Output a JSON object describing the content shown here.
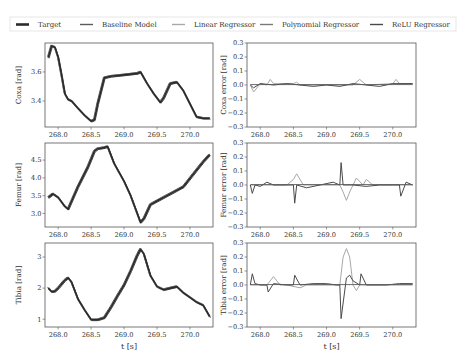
{
  "legend": {
    "items": [
      {
        "label": "Target",
        "color": "#2b2b2b",
        "width": 2.2
      },
      {
        "label": "Baseline Model",
        "color": "#5a5a5a",
        "width": 1.0
      },
      {
        "label": "Linear Regressor",
        "color": "#a8a8a8",
        "width": 1.0
      },
      {
        "label": "Polynomial Regressor",
        "color": "#7a7a7a",
        "width": 1.0
      },
      {
        "label": "ReLU Regressor",
        "color": "#4a4a4a",
        "width": 1.0
      }
    ]
  },
  "chart_data": [
    {
      "type": "line",
      "panel": "coxa",
      "ylabel": "Coxa [rad]",
      "xlabel": "",
      "xlim": [
        267.8,
        270.35
      ],
      "ylim": [
        3.22,
        3.8
      ],
      "xticks": [
        "268.0",
        "268.5",
        "269.0",
        "269.5",
        "270.0"
      ],
      "xtick_values": [
        268.0,
        268.5,
        269.0,
        269.5,
        270.0
      ],
      "yticks": [
        "3.4",
        "3.6"
      ],
      "ytick_values": [
        3.4,
        3.6
      ],
      "series": [
        {
          "name": "Target",
          "x": [
            267.85,
            267.9,
            267.95,
            268.0,
            268.05,
            268.1,
            268.15,
            268.2,
            268.3,
            268.4,
            268.5,
            268.55,
            268.6,
            268.7,
            268.8,
            269.0,
            269.2,
            269.25,
            269.35,
            269.45,
            269.55,
            269.6,
            269.7,
            269.8,
            269.9,
            270.0,
            270.1,
            270.2,
            270.3
          ],
          "y": [
            3.7,
            3.78,
            3.77,
            3.7,
            3.58,
            3.45,
            3.41,
            3.4,
            3.35,
            3.3,
            3.26,
            3.27,
            3.38,
            3.56,
            3.57,
            3.58,
            3.59,
            3.6,
            3.52,
            3.45,
            3.39,
            3.42,
            3.52,
            3.53,
            3.47,
            3.38,
            3.29,
            3.28,
            3.28
          ]
        }
      ]
    },
    {
      "type": "line",
      "panel": "coxa-error",
      "ylabel": "Coxa error [rad]",
      "xlabel": "",
      "xlim": [
        267.8,
        270.35
      ],
      "ylim": [
        -0.3,
        0.3
      ],
      "xticks": [
        "268.0",
        "268.5",
        "269.0",
        "269.5",
        "270.0"
      ],
      "xtick_values": [
        268.0,
        268.5,
        269.0,
        269.5,
        270.0
      ],
      "yticks": [
        "0.3",
        "0.2",
        "0.1",
        "0.0",
        "−0.1",
        "−0.2",
        "−0.3"
      ],
      "ytick_values": [
        0.3,
        0.2,
        0.1,
        0.0,
        -0.1,
        -0.2,
        -0.3
      ],
      "series": [
        {
          "name": "Linear Regressor",
          "x": [
            267.85,
            267.9,
            268.0,
            268.1,
            268.15,
            268.2,
            268.5,
            268.55,
            268.6,
            269.0,
            269.4,
            269.5,
            269.55,
            269.6,
            270.0,
            270.05,
            270.1,
            270.3
          ],
          "y": [
            0.0,
            -0.05,
            0.01,
            0.0,
            0.04,
            0.01,
            0.01,
            0.02,
            0.0,
            0.0,
            0.0,
            0.04,
            0.02,
            0.0,
            0.01,
            0.04,
            0.01,
            0.01
          ]
        },
        {
          "name": "ReLU Regressor",
          "x": [
            267.85,
            267.9,
            268.0,
            268.2,
            268.4,
            268.6,
            268.8,
            269.0,
            269.2,
            269.4,
            269.6,
            269.8,
            270.0,
            270.2,
            270.3
          ],
          "y": [
            0.0,
            -0.02,
            0.01,
            0.0,
            0.01,
            0.0,
            -0.01,
            0.0,
            -0.01,
            0.01,
            0.0,
            -0.01,
            0.01,
            0.01,
            0.01
          ]
        }
      ]
    },
    {
      "type": "line",
      "panel": "femur",
      "ylabel": "Femur [rad]",
      "xlabel": "",
      "xlim": [
        267.8,
        270.35
      ],
      "ylim": [
        2.62,
        4.98
      ],
      "xticks": [
        "268.0",
        "268.5",
        "269.0",
        "269.5",
        "270.0"
      ],
      "xtick_values": [
        268.0,
        268.5,
        269.0,
        269.5,
        270.0
      ],
      "yticks": [
        "3.0",
        "3.5",
        "4.0",
        "4.5"
      ],
      "ytick_values": [
        3.0,
        3.5,
        4.0,
        4.5
      ],
      "series": [
        {
          "name": "Target",
          "x": [
            267.85,
            267.92,
            268.0,
            268.1,
            268.15,
            268.3,
            268.45,
            268.55,
            268.6,
            268.7,
            268.75,
            268.85,
            269.0,
            269.1,
            269.2,
            269.25,
            269.3,
            269.4,
            269.5,
            269.7,
            269.9,
            270.05,
            270.2,
            270.3
          ],
          "y": [
            3.45,
            3.55,
            3.45,
            3.2,
            3.12,
            3.75,
            4.3,
            4.75,
            4.82,
            4.85,
            4.88,
            4.4,
            3.9,
            3.5,
            3.0,
            2.75,
            2.85,
            3.25,
            3.35,
            3.55,
            3.75,
            4.1,
            4.45,
            4.65
          ]
        }
      ]
    },
    {
      "type": "line",
      "panel": "femur-error",
      "ylabel": "Femur error [rad]",
      "xlabel": "",
      "xlim": [
        267.8,
        270.35
      ],
      "ylim": [
        -0.3,
        0.3
      ],
      "xticks": [
        "268.0",
        "268.5",
        "269.0",
        "269.5",
        "270.0"
      ],
      "xtick_values": [
        268.0,
        268.5,
        269.0,
        269.5,
        270.0
      ],
      "yticks": [
        "0.3",
        "0.2",
        "0.1",
        "0.0",
        "−0.1",
        "−0.2",
        "−0.3"
      ],
      "ytick_values": [
        0.3,
        0.2,
        0.1,
        0.0,
        -0.1,
        -0.2,
        -0.3
      ],
      "series": [
        {
          "name": "Linear Regressor",
          "x": [
            267.85,
            268.4,
            268.5,
            268.55,
            268.65,
            268.8,
            269.0,
            269.2,
            269.25,
            269.3,
            269.35,
            269.45,
            269.55,
            269.6,
            269.7,
            270.3
          ],
          "y": [
            0.0,
            0.0,
            0.04,
            0.08,
            0.0,
            0.0,
            0.0,
            0.0,
            -0.05,
            -0.11,
            -0.05,
            0.05,
            0.0,
            0.04,
            0.0,
            0.0
          ]
        },
        {
          "name": "ReLU Regressor",
          "x": [
            267.85,
            267.88,
            267.92,
            268.0,
            268.1,
            268.2,
            268.4,
            268.5,
            268.52,
            268.55,
            268.7,
            268.9,
            269.1,
            269.2,
            269.22,
            269.25,
            269.4,
            269.6,
            269.8,
            270.0,
            270.1,
            270.12,
            270.2,
            270.3
          ],
          "y": [
            0.0,
            -0.06,
            0.0,
            -0.01,
            0.02,
            0.0,
            0.0,
            0.0,
            -0.13,
            0.0,
            -0.02,
            0.0,
            0.02,
            0.0,
            0.16,
            0.0,
            0.0,
            -0.01,
            0.0,
            0.0,
            0.0,
            -0.08,
            0.02,
            0.0
          ]
        }
      ]
    },
    {
      "type": "line",
      "panel": "tibia",
      "ylabel": "Tibia [rad]",
      "xlabel": "t [s]",
      "xlim": [
        267.8,
        270.35
      ],
      "ylim": [
        0.75,
        3.45
      ],
      "xticks": [
        "268.0",
        "268.5",
        "269.0",
        "269.5",
        "270.0"
      ],
      "xtick_values": [
        268.0,
        268.5,
        269.0,
        269.5,
        270.0
      ],
      "yticks": [
        "1",
        "2",
        "3"
      ],
      "ytick_values": [
        1,
        2,
        3
      ],
      "series": [
        {
          "name": "Target",
          "x": [
            267.85,
            267.9,
            267.95,
            268.0,
            268.1,
            268.15,
            268.2,
            268.3,
            268.4,
            268.5,
            268.6,
            268.7,
            268.8,
            268.9,
            269.0,
            269.1,
            269.2,
            269.25,
            269.3,
            269.4,
            269.5,
            269.6,
            269.7,
            269.8,
            269.9,
            270.0,
            270.1,
            270.2,
            270.3
          ],
          "y": [
            2.0,
            1.88,
            1.9,
            2.0,
            2.25,
            2.33,
            2.2,
            1.65,
            1.3,
            0.98,
            0.98,
            1.05,
            1.38,
            1.75,
            2.1,
            2.55,
            3.05,
            3.25,
            3.1,
            2.4,
            2.05,
            1.95,
            2.0,
            2.05,
            1.85,
            1.7,
            1.55,
            1.45,
            1.08
          ]
        }
      ]
    },
    {
      "type": "line",
      "panel": "tibia-error",
      "ylabel": "Tibia error [rad]",
      "xlabel": "t [s]",
      "xlim": [
        267.8,
        270.35
      ],
      "ylim": [
        -0.3,
        0.3
      ],
      "xticks": [
        "268.0",
        "268.5",
        "269.0",
        "269.5",
        "270.0"
      ],
      "xtick_values": [
        268.0,
        268.5,
        269.0,
        269.5,
        270.0
      ],
      "yticks": [
        "0.3",
        "0.2",
        "0.1",
        "0.0",
        "−0.1",
        "−0.2",
        "−0.3"
      ],
      "ytick_values": [
        0.3,
        0.2,
        0.1,
        0.0,
        -0.1,
        -0.2,
        -0.3
      ],
      "series": [
        {
          "name": "Linear Regressor",
          "x": [
            267.85,
            268.1,
            268.2,
            268.3,
            268.4,
            268.6,
            268.7,
            268.8,
            269.2,
            269.25,
            269.3,
            269.35,
            269.4,
            269.45,
            269.5,
            269.7,
            270.3
          ],
          "y": [
            0.0,
            0.0,
            0.06,
            0.0,
            0.0,
            -0.02,
            0.0,
            0.0,
            0.0,
            0.2,
            0.26,
            0.2,
            0.0,
            -0.04,
            0.0,
            0.0,
            0.0
          ]
        },
        {
          "name": "ReLU Regressor",
          "x": [
            267.85,
            267.88,
            267.92,
            268.0,
            268.1,
            268.12,
            268.2,
            268.4,
            268.5,
            268.52,
            268.6,
            268.8,
            269.0,
            269.15,
            269.2,
            269.22,
            269.3,
            269.35,
            269.4,
            269.5,
            269.52,
            269.6,
            269.9,
            270.1,
            270.3
          ],
          "y": [
            0.0,
            0.08,
            0.01,
            0.0,
            0.0,
            -0.05,
            0.01,
            0.0,
            0.0,
            0.07,
            0.0,
            0.01,
            0.01,
            0.0,
            0.0,
            -0.24,
            0.05,
            0.07,
            0.03,
            0.0,
            0.08,
            0.0,
            0.0,
            0.01,
            0.01
          ]
        }
      ]
    }
  ]
}
